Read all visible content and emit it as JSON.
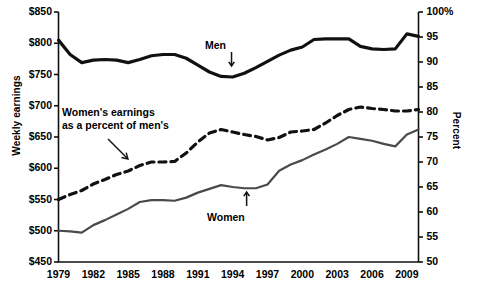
{
  "chart_data": {
    "type": "line",
    "title": "",
    "xlabel": "",
    "ylabel": "Weekly earnings",
    "y2label": "Percent",
    "grid": false,
    "legend_position": "inline-annotations",
    "xlim": [
      1979,
      2010
    ],
    "ylim": [
      450,
      850
    ],
    "y2lim": [
      50,
      100
    ],
    "x": [
      1979,
      1980,
      1981,
      1982,
      1983,
      1984,
      1985,
      1986,
      1987,
      1988,
      1989,
      1990,
      1991,
      1992,
      1993,
      1994,
      1995,
      1996,
      1997,
      1998,
      1999,
      2000,
      2001,
      2002,
      2003,
      2004,
      2005,
      2006,
      2007,
      2008,
      2009,
      2010
    ],
    "xticks": [
      "1979",
      "1982",
      "1985",
      "1988",
      "1991",
      "1994",
      "1997",
      "2000",
      "2003",
      "2006",
      "2009"
    ],
    "xtick_values": [
      1979,
      1982,
      1985,
      1988,
      1991,
      1994,
      1997,
      2000,
      2003,
      2006,
      2009
    ],
    "yticks": [
      "$450",
      "$500",
      "$550",
      "$600",
      "$650",
      "$700",
      "$750",
      "$800",
      "$850"
    ],
    "ytick_values": [
      450,
      500,
      550,
      600,
      650,
      700,
      750,
      800,
      850
    ],
    "y2ticks": [
      "50",
      "55",
      "60",
      "65",
      "70",
      "75",
      "80",
      "85",
      "90",
      "95",
      "100%"
    ],
    "y2tick_values": [
      50,
      55,
      60,
      65,
      70,
      75,
      80,
      85,
      90,
      95,
      100
    ],
    "series": [
      {
        "name": "Men",
        "axis": "left",
        "style": "solid",
        "width": 3.2,
        "color": "#111111",
        "values": [
          805,
          782,
          769,
          773,
          774,
          773,
          769,
          774,
          780,
          782,
          782,
          776,
          765,
          754,
          747,
          746,
          752,
          761,
          771,
          781,
          789,
          794,
          806,
          807,
          807,
          807,
          795,
          791,
          790,
          791,
          815,
          811
        ]
      },
      {
        "name": "Women",
        "axis": "left",
        "style": "solid",
        "width": 2.2,
        "color": "#4a4a4a",
        "values": [
          500,
          499,
          497,
          509,
          517,
          526,
          535,
          546,
          549,
          549,
          548,
          553,
          561,
          567,
          573,
          570,
          568,
          568,
          574,
          596,
          606,
          613,
          622,
          630,
          639,
          650,
          647,
          644,
          639,
          635,
          654,
          662
        ]
      },
      {
        "name": "Women's earnings as a percent of men's",
        "axis": "right",
        "style": "dashed",
        "width": 3.2,
        "color": "#111111",
        "values": [
          62.5,
          63.5,
          64.3,
          65.6,
          66.5,
          67.5,
          68.2,
          69.3,
          70.0,
          70.0,
          70.1,
          71.8,
          74.0,
          75.8,
          76.5,
          76.0,
          75.5,
          75.1,
          74.4,
          74.9,
          76.0,
          76.2,
          76.5,
          77.8,
          79.3,
          80.5,
          81.0,
          80.7,
          80.5,
          80.2,
          80.2,
          80.5
        ]
      }
    ],
    "annotations": [
      {
        "name": "men-label",
        "text": "Men",
        "x": 1993.9,
        "arrow": "down"
      },
      {
        "name": "women-label",
        "text": "Women",
        "x": 1995.2,
        "arrow": "up"
      },
      {
        "name": "percent-label",
        "line1": "Women's earnings",
        "line2": "as a percent of men's",
        "arrow": "diagonal-down-right"
      }
    ]
  },
  "axes": {
    "left_title": "Weekly earnings",
    "right_title": "Percent"
  },
  "annotations": {
    "men": "Men",
    "women": "Women",
    "percent_line1": "Women's earnings",
    "percent_line2": "as a percent of men's"
  }
}
